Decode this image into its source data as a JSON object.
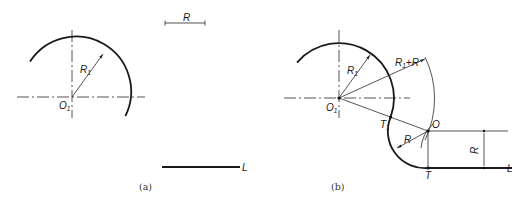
{
  "figure_a": {
    "caption": "(a)",
    "center_label": "O",
    "center_label_sub": "1",
    "radius_label": "R",
    "radius_label_sub": "1",
    "scale_bar_label": "R",
    "line_label": "L"
  },
  "figure_b": {
    "caption": "(b)",
    "center_label": "O",
    "center_label_sub": "1",
    "radius_label": "R",
    "radius_label_sub": "1",
    "sum_radius_label_a": "R",
    "sum_radius_label_sub": "1",
    "sum_radius_label_b": "+R",
    "tangent_point_label": "T",
    "tangent_point_label_sub": "1",
    "arc_center_label": "O",
    "arc_radius_label": "R",
    "tangent_point_line_label": "T",
    "offset_dim_label": "R",
    "line_label": "L"
  },
  "colors": {
    "line": "#1a1a1a",
    "background": "#ffffff"
  }
}
